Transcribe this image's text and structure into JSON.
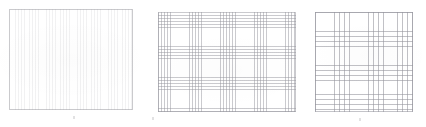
{
  "figure": {
    "title": "",
    "caption": "",
    "background_color": "#ffffff",
    "panel_count": 3
  },
  "chart_data": {
    "type": "heatmap",
    "title": "",
    "subtitle": "",
    "xlabel": "",
    "ylabel": "",
    "grid": true,
    "legend_position": "none",
    "panels": [
      {
        "id": "panel-1",
        "label": "",
        "mesh_type": "fine",
        "line_color": "#96969b",
        "h_line_spacing_px": 2.0,
        "v_line_spacing_px": 1.55,
        "h_line_count": 50,
        "v_line_count": 80,
        "width_px": 124,
        "height_px": 101,
        "x_px": 9,
        "y_px": 9
      },
      {
        "id": "panel-2",
        "label": "",
        "mesh_type": "medium",
        "line_color": "#96969e",
        "h_line_spacing_px": 3.1,
        "v_line_spacing_px": 3.1,
        "h_line_count": 32,
        "v_line_count": 45,
        "width_px": 138,
        "height_px": 100,
        "x_px": 158,
        "y_px": 12
      },
      {
        "id": "panel-3",
        "label": "",
        "mesh_type": "coarse",
        "line_color": "#94949c",
        "h_line_spacing_px": 4.85,
        "v_line_spacing_px": 4.85,
        "h_line_count": 21,
        "v_line_count": 20,
        "width_px": 98,
        "height_px": 100,
        "x_px": 315,
        "y_px": 12
      }
    ],
    "colors": {
      "background": "#ffffff",
      "grid_line": "#96969b",
      "border": "#96969b"
    }
  }
}
